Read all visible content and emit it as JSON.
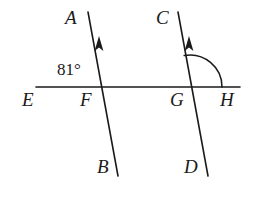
{
  "figure": {
    "kind": "geometry-diagram",
    "background_color": "#ffffff",
    "stroke_color": "#1a1a1a",
    "text_color": "#1a1a1a",
    "stroke_width": 1.6,
    "width": 254,
    "height": 198
  },
  "lines": {
    "horizontal": {
      "name": "EH",
      "x1": 36,
      "y1": 87,
      "x2": 240,
      "y2": 87
    },
    "transversal_left": {
      "name": "AB",
      "x1": 88,
      "y1": 12,
      "x2": 118,
      "y2": 176,
      "arrow_direction": "up",
      "arrow_x": 99,
      "arrow_y": 44
    },
    "transversal_right": {
      "name": "CD",
      "x1": 178,
      "y1": 12,
      "x2": 208,
      "y2": 176,
      "arrow_direction": "up",
      "arrow_x": 189,
      "arrow_y": 44
    }
  },
  "intersections": {
    "F": {
      "x": 100,
      "y": 87
    },
    "G": {
      "x": 190,
      "y": 87
    }
  },
  "arc": {
    "name": "angle-arc-at-G",
    "center_x": 190,
    "center_y": 87,
    "radius": 32,
    "from": "ray GC",
    "to": "ray GH"
  },
  "point_labels": [
    {
      "id": "A",
      "text": "A",
      "x": 65,
      "y": 8
    },
    {
      "id": "C",
      "text": "C",
      "x": 156,
      "y": 8
    },
    {
      "id": "B",
      "text": "B",
      "x": 97,
      "y": 157
    },
    {
      "id": "D",
      "text": "D",
      "x": 184,
      "y": 157
    },
    {
      "id": "E",
      "text": "E",
      "x": 22,
      "y": 90
    },
    {
      "id": "F",
      "text": "F",
      "x": 80,
      "y": 90
    },
    {
      "id": "G",
      "text": "G",
      "x": 170,
      "y": 90
    },
    {
      "id": "H",
      "text": "H",
      "x": 220,
      "y": 90
    }
  ],
  "angle_measures": [
    {
      "id": "angle-at-F",
      "text": "81°",
      "value": 81,
      "unit": "degrees",
      "x": 57,
      "y": 61,
      "at_vertex": "F"
    }
  ]
}
